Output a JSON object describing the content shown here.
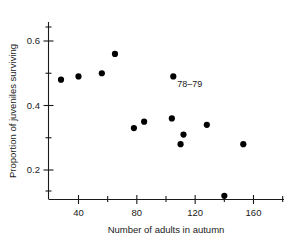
{
  "chart_data": {
    "type": "scatter",
    "title": "",
    "xlabel": "Number of adults in autumn",
    "ylabel": "Proportion of juveniles surviving",
    "xlim": [
      22,
      172
    ],
    "ylim": [
      0.075,
      0.645
    ],
    "xticks": [
      40,
      80,
      120,
      160
    ],
    "xtick_labels": [
      "40",
      "80",
      "120",
      "160"
    ],
    "yticks": [
      0.2,
      0.4,
      0.6
    ],
    "ytick_labels": [
      "0.2",
      "0.4",
      "0.6"
    ],
    "grid": false,
    "legend": "none",
    "marker": "filled-circle",
    "marker_color": "#000000",
    "x": [
      28,
      40,
      56,
      65,
      78,
      85,
      104,
      105,
      110,
      112,
      128,
      140,
      153
    ],
    "y": [
      0.48,
      0.49,
      0.5,
      0.56,
      0.33,
      0.35,
      0.36,
      0.49,
      0.28,
      0.31,
      0.34,
      0.12,
      0.28
    ],
    "annotations": [
      {
        "text": "78–79",
        "x": 105,
        "y": 0.49,
        "dx_px": 4,
        "dy_px": 11
      }
    ]
  },
  "axis_titles": {
    "x": "Number of adults in autumn",
    "y": "Proportion of juveniles surviving"
  }
}
